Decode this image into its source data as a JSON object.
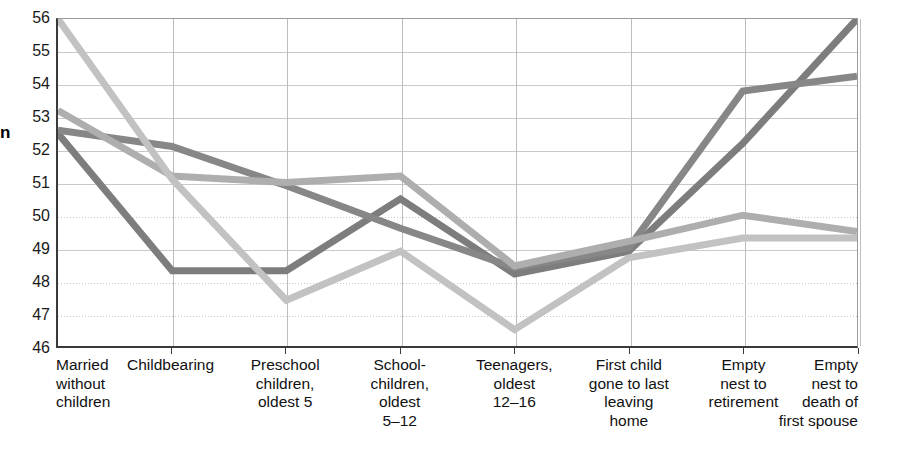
{
  "chart_data": {
    "type": "line",
    "title": "",
    "xlabel": "",
    "ylabel": "n",
    "ylim": [
      46,
      56
    ],
    "ytick_labels": [
      "56",
      "55",
      "54",
      "53",
      "52",
      "51",
      "50",
      "49",
      "48",
      "47",
      "46"
    ],
    "grid": true,
    "legend": "none",
    "categories": [
      "Married without children",
      "Childbearing",
      "Preschool children, oldest 5",
      "School-children, oldest 5–12",
      "Teenagers, oldest 12–16",
      "First child gone to last leaving home",
      "Empty nest to retirement",
      "Empty nest to death of first spouse"
    ],
    "category_lines": [
      [
        "Married",
        "without",
        "children"
      ],
      [
        "Childbearing"
      ],
      [
        "Preschool",
        "children,",
        "oldest 5"
      ],
      [
        "School-",
        "children,",
        "oldest",
        "5–12"
      ],
      [
        "Teenagers,",
        "oldest",
        "12–16"
      ],
      [
        "First child",
        "gone to last",
        "leaving",
        "home"
      ],
      [
        "Empty",
        "nest to",
        "retirement"
      ],
      [
        "Empty",
        "nest to",
        "death of",
        "first spouse"
      ]
    ],
    "series": [
      {
        "name": "series-1",
        "color": "#7d7d7d",
        "values": [
          52.5,
          48.3,
          48.3,
          50.5,
          48.2,
          48.9,
          52.2,
          56.0
        ]
      },
      {
        "name": "series-2",
        "color": "#878787",
        "values": [
          52.6,
          52.1,
          50.9,
          49.6,
          48.4,
          49.0,
          53.8,
          54.25
        ]
      },
      {
        "name": "series-3",
        "color": "#aeaeae",
        "values": [
          53.2,
          51.2,
          51.0,
          51.2,
          48.45,
          49.2,
          50.0,
          49.5
        ]
      },
      {
        "name": "series-4",
        "color": "#c2c2c2",
        "values": [
          56.0,
          51.1,
          47.4,
          48.9,
          46.5,
          48.7,
          49.3,
          49.3
        ]
      }
    ]
  }
}
